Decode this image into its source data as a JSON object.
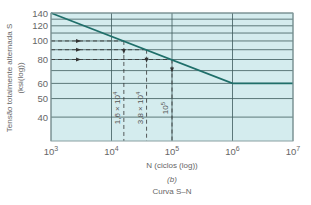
{
  "chart_data": {
    "type": "line",
    "title": "",
    "subtitle": "(b)",
    "caption": "Curva S–N",
    "xlabel": "N (ciclos (log))",
    "ylabel": "Tensão totalmente alternada S",
    "ylabel_units": "(ksi(log))",
    "xscale": "log",
    "yscale": "log",
    "xlim": [
      1000,
      10000000
    ],
    "ylim": [
      30,
      140
    ],
    "x_ticks": [
      {
        "value": 1000,
        "label_base": "10",
        "label_exp": "3"
      },
      {
        "value": 10000,
        "label_base": "10",
        "label_exp": "4"
      },
      {
        "value": 100000,
        "label_base": "10",
        "label_exp": "5"
      },
      {
        "value": 1000000,
        "label_base": "10",
        "label_exp": "6"
      },
      {
        "value": 10000000,
        "label_base": "10",
        "label_exp": "7"
      }
    ],
    "y_gridlines": [
      140,
      130,
      120,
      110,
      100,
      90,
      80,
      70,
      60,
      50,
      40
    ],
    "y_ticks": [
      140,
      120,
      100,
      80,
      60,
      50,
      40
    ],
    "grid": true,
    "series": [
      {
        "name": "S-N curve",
        "color": "#1f6f6a",
        "x": [
          1000,
          1000000,
          10000000
        ],
        "y": [
          140,
          60,
          60
        ]
      }
    ],
    "annotations": [
      {
        "stress": 100,
        "cycles": 16000,
        "label": "1,6 × 10",
        "exp": "4"
      },
      {
        "stress": 90,
        "cycles": 38000,
        "label": "3,8 × 10",
        "exp": "4"
      },
      {
        "stress": 80,
        "cycles": 100000,
        "label": "10",
        "exp": "5"
      }
    ]
  },
  "colors": {
    "plot_background": "#d4ecee",
    "grid": "#3e5a5c",
    "curve": "#1f6f6a",
    "dash": "#333333",
    "text": "#666666"
  }
}
